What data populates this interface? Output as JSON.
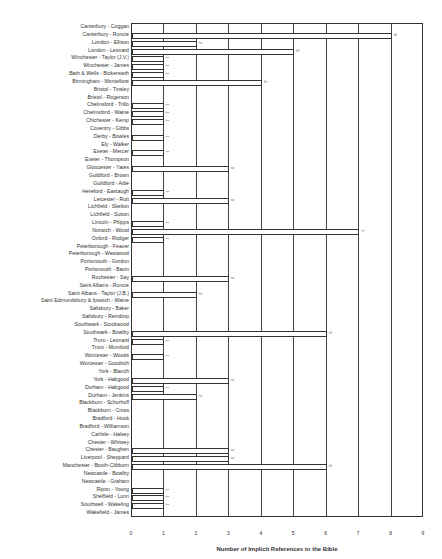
{
  "chart_data": {
    "type": "bar",
    "orientation": "horizontal",
    "title": "",
    "xlabel": "Number of Implicit References to the Bible",
    "ylabel": "",
    "xlim": [
      0,
      9
    ],
    "xticks": [
      "0",
      "1",
      "2",
      "3",
      "4",
      "5",
      "6",
      "7",
      "8",
      "9"
    ],
    "grid": "vertical",
    "legend": "none",
    "categories": [
      "Canterbury - Coggan",
      "Canterbury - Runcie",
      "London - Ellison",
      "London - Leonard",
      "Winchester - Taylor (J.V.)",
      "Winchester - James",
      "Bath & Wells - Bickersteth",
      "Birmingham - Montefiore",
      "Bristol - Tinsley",
      "Bristol - Rogerson",
      "Chelmsford - Trillo",
      "Chelmsford - Waine",
      "Chichester - Kemp",
      "Coventry - Gibbs",
      "Derby - Bowles",
      "Ely - Walker",
      "Exeter - Mercer",
      "Exeter - Thompson",
      "Gloucester - Yates",
      "Guildford - Brown",
      "Guildford - Adie",
      "Hereford - Eastaugh",
      "Leicester - Rutt",
      "Lichfield - Skelton",
      "Lichfield - Sutton",
      "Lincoln - Phipps",
      "Norwich - Wood",
      "Oxford - Rodger",
      "Peterborough - Feaver",
      "Peterborough - Westwood",
      "Portsmouth - Gordon",
      "Portsmouth - Bavin",
      "Rochester - Say",
      "Saint Albans - Runcie",
      "Saint Albans - Taylor (J.B.)",
      "Saint Edmundsbury & Ipswich - Waine",
      "Salisbury - Baker",
      "Salisbury - Reindorp",
      "Southwark - Stockwood",
      "Southwark - Bowlby",
      "Truro - Leonard",
      "Truro - Mumford",
      "Worcester - Woods",
      "Worcester - Goodrich",
      "York - Blanch",
      "York - Habgood",
      "Durham - Habgood",
      "Durham - Jenkins",
      "Blackburn - Schurhoff",
      "Blackburn - Cross",
      "Bradford - Hook",
      "Bradford - Williamson",
      "Carlisle - Halsey",
      "Chester - Whitsey",
      "Chester - Baughen",
      "Liverpool - Sheppard",
      "Manchester - Booth-Clibborn",
      "Newcastle - Bowlby",
      "Newcastle - Graham",
      "Ripon - Young",
      "Sheffield - Lunn",
      "Southwell - Wakeling",
      "Wakefield - James"
    ],
    "values": [
      0,
      8,
      2,
      5,
      1,
      1,
      1,
      4,
      0,
      0,
      1,
      1,
      1,
      0,
      1,
      0,
      1,
      0,
      3,
      0,
      0,
      1,
      3,
      0,
      0,
      1,
      7,
      1,
      0,
      0,
      0,
      0,
      3,
      0,
      2,
      0,
      0,
      0,
      0,
      6,
      1,
      0,
      1,
      0,
      0,
      3,
      1,
      2,
      0,
      0,
      0,
      0,
      0,
      0,
      3,
      3,
      6,
      0,
      0,
      1,
      1,
      1,
      0
    ]
  }
}
